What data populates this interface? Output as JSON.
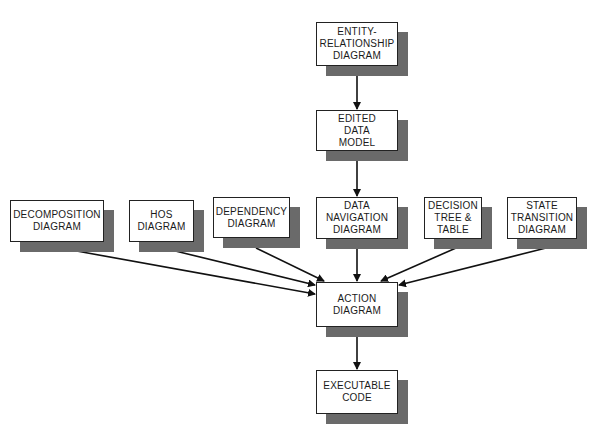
{
  "diagram": {
    "nodes": [
      {
        "id": "entity_relationship",
        "label": "ENTITY-\nRELATIONSHIP\nDIAGRAM",
        "x": 316,
        "y": 22,
        "w": 82,
        "h": 44
      },
      {
        "id": "edited_data_model",
        "label": "EDITED\nDATA\nMODEL",
        "x": 316,
        "y": 110,
        "w": 82,
        "h": 41
      },
      {
        "id": "decomposition",
        "label": "DECOMPOSITION\nDIAGRAM",
        "x": 10,
        "y": 200,
        "w": 94,
        "h": 42
      },
      {
        "id": "hos",
        "label": "HOS\nDIAGRAM",
        "x": 129,
        "y": 200,
        "w": 65,
        "h": 42
      },
      {
        "id": "dependency",
        "label": "DEPENDENCY\nDIAGRAM",
        "x": 213,
        "y": 197,
        "w": 77,
        "h": 41
      },
      {
        "id": "data_navigation",
        "label": "DATA\nNAVIGATION\nDIAGRAM",
        "x": 316,
        "y": 197,
        "w": 82,
        "h": 42
      },
      {
        "id": "decision_tree",
        "label": "DECISION\nTREE &\nTABLE",
        "x": 424,
        "y": 197,
        "w": 58,
        "h": 42
      },
      {
        "id": "state_transition",
        "label": "STATE\nTRANSITION\nDIAGRAM",
        "x": 507,
        "y": 197,
        "w": 70,
        "h": 42
      },
      {
        "id": "action",
        "label": "ACTION\nDIAGRAM",
        "x": 316,
        "y": 282,
        "w": 82,
        "h": 45
      },
      {
        "id": "executable_code",
        "label": "EXECUTABLE\nCODE",
        "x": 316,
        "y": 370,
        "w": 82,
        "h": 44
      }
    ],
    "edges": [
      {
        "from": "entity_relationship",
        "to": "edited_data_model"
      },
      {
        "from": "edited_data_model",
        "to": "data_navigation"
      },
      {
        "from": "decomposition",
        "to": "action"
      },
      {
        "from": "hos",
        "to": "action"
      },
      {
        "from": "dependency",
        "to": "action"
      },
      {
        "from": "data_navigation",
        "to": "action"
      },
      {
        "from": "decision_tree",
        "to": "action"
      },
      {
        "from": "state_transition",
        "to": "action"
      },
      {
        "from": "action",
        "to": "executable_code"
      }
    ],
    "colors": {
      "shadow": "#6a6a6a",
      "line": "#111111",
      "box_border": "#222222"
    }
  }
}
